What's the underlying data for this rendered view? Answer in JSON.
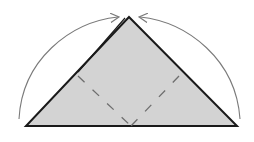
{
  "diagram": {
    "type": "origami-fold-step",
    "colors": {
      "background": "#ffffff",
      "paper_fill": "#d3d3d3",
      "edge": "#1a1a1a",
      "arrow": "#7a7a7a",
      "fold_line": "#6e6e6e"
    },
    "triangle": {
      "apex": [
        129,
        17
      ],
      "base_left": [
        26,
        126
      ],
      "base_right": [
        237,
        126
      ]
    },
    "fold_lines": [
      {
        "style": "valley-dashed",
        "from": [
          78,
          76
        ],
        "to": [
          131,
          126
        ]
      },
      {
        "style": "valley-dashed",
        "from": [
          179,
          76
        ],
        "to": [
          131,
          126
        ]
      }
    ],
    "arrows": [
      {
        "name": "left-corner-fold-arrow",
        "from": [
          19,
          119
        ],
        "to": [
          118,
          17
        ]
      },
      {
        "name": "right-corner-fold-arrow",
        "from": [
          240,
          119
        ],
        "to": [
          140,
          17
        ]
      }
    ]
  }
}
